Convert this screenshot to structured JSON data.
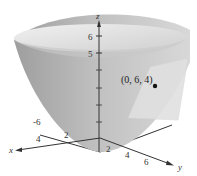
{
  "figure": {
    "type": "3d-surface-plot",
    "surface": "paraboloid",
    "tangent_plane": true,
    "point": {
      "label": "(0, 6, 4)",
      "x": 0,
      "y": 6,
      "z": 4
    }
  },
  "axes": {
    "x": {
      "label": "x",
      "ticks": [
        "4",
        "2"
      ]
    },
    "y": {
      "label": "y",
      "ticks": [
        "-6",
        "2",
        "4",
        "6"
      ]
    },
    "z": {
      "label": "z",
      "ticks": [
        "6",
        "5"
      ]
    }
  },
  "colors": {
    "surface_rim": "#e4e4e4",
    "surface_outer": "#b9b9b9",
    "surface_inner": "#d0d0d0",
    "plane": "#dcdcdc",
    "axis": "#333333"
  }
}
